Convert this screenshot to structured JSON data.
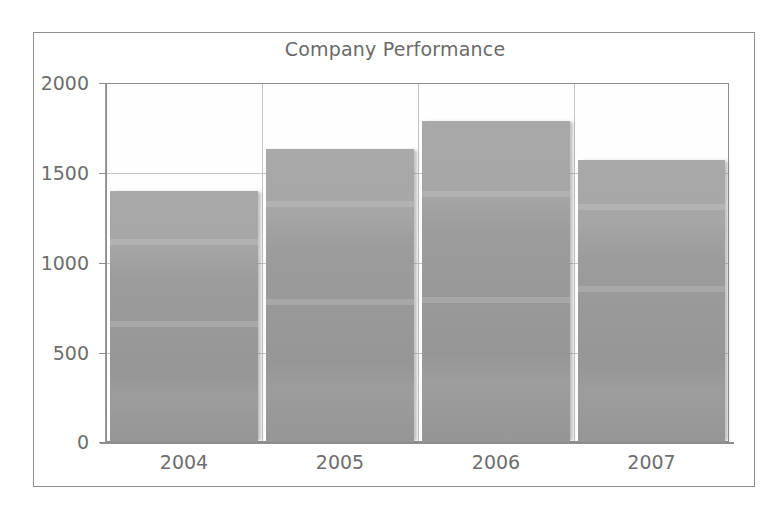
{
  "chart_data": {
    "type": "bar",
    "title": "Company Performance",
    "xlabel": "",
    "ylabel": "",
    "categories": [
      "2004",
      "2005",
      "2006",
      "2007"
    ],
    "values": [
      1400,
      1630,
      1790,
      1570
    ],
    "series": [
      {
        "name": "Performance",
        "values": [
          1400,
          1630,
          1790,
          1570
        ]
      }
    ],
    "ylim": [
      0,
      2000
    ],
    "yticks": [
      0,
      500,
      1000,
      1500,
      2000
    ],
    "ytick_labels": [
      "0",
      "500",
      "1000",
      "1500",
      "2000"
    ],
    "xtick_labels": [
      "2004",
      "2005",
      "2006",
      "2007"
    ],
    "grid": true,
    "grid_axis": "both",
    "legend": false,
    "legend_position": "none",
    "bar_color": "#9a9a9a",
    "title_color": "#6a6a6a",
    "tick_label_color": "#6d6d6d",
    "grid_color": "#bdbdbd",
    "axis_color": "#8d8d8d",
    "plot_background": "#ffffff",
    "frame_border_color": "#8f8f8f"
  }
}
